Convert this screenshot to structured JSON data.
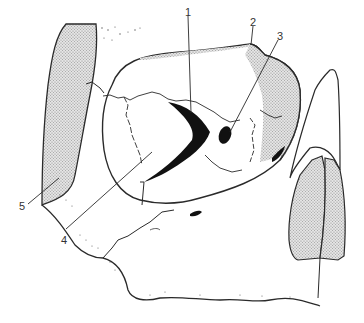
{
  "figure": {
    "labels": [
      {
        "id": "1",
        "text": "1",
        "x": 185,
        "y": 7
      },
      {
        "id": "2",
        "text": "2",
        "x": 250,
        "y": 17
      },
      {
        "id": "3",
        "text": "3",
        "x": 277,
        "y": 31
      },
      {
        "id": "4",
        "text": "4",
        "x": 61,
        "y": 235
      },
      {
        "id": "5",
        "text": "5",
        "x": 19,
        "y": 201
      }
    ],
    "colors": {
      "line": "#2a2a2a",
      "fill_dark": "#111111",
      "stipple_bg": "#e2e2e2",
      "stipple_dot": "#8a8a8a",
      "background": "#ffffff"
    }
  }
}
